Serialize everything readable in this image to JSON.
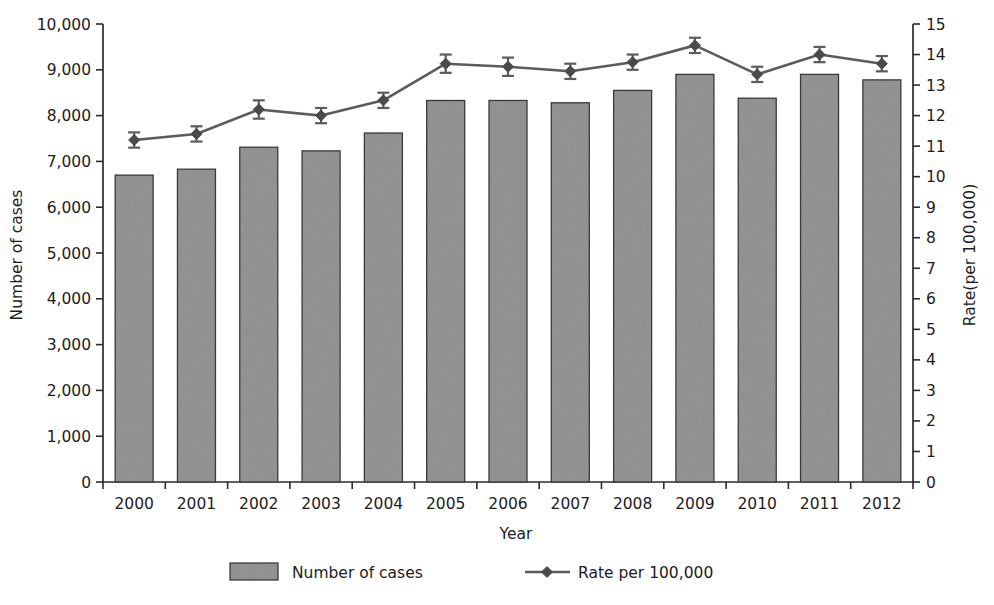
{
  "chart_data": {
    "type": "bar",
    "title": "",
    "subtitle": "",
    "xlabel": "Year",
    "ylabel": "Number of cases",
    "y2label": "Rate(per 100,000)",
    "categories": [
      "2000",
      "2001",
      "2002",
      "2003",
      "2004",
      "2005",
      "2006",
      "2007",
      "2008",
      "2009",
      "2010",
      "2011",
      "2012"
    ],
    "ylim": [
      0,
      10000
    ],
    "y2lim": [
      0,
      15
    ],
    "grid": false,
    "legend_position": "bottom",
    "y_ticks": [
      "0",
      "1,000",
      "2,000",
      "3,000",
      "4,000",
      "5,000",
      "6,000",
      "7,000",
      "8,000",
      "9,000",
      "10,000"
    ],
    "y_tick_values": [
      0,
      1000,
      2000,
      3000,
      4000,
      5000,
      6000,
      7000,
      8000,
      9000,
      10000
    ],
    "y2_ticks": [
      "0",
      "1",
      "2",
      "3",
      "4",
      "5",
      "6",
      "7",
      "8",
      "9",
      "10",
      "11",
      "12",
      "13",
      "14",
      "15"
    ],
    "y2_tick_values": [
      0,
      1,
      2,
      3,
      4,
      5,
      6,
      7,
      8,
      9,
      10,
      11,
      12,
      13,
      14,
      15
    ],
    "series": [
      {
        "name": "Number of cases",
        "kind": "bar",
        "axis": "left",
        "color": "#8a8a8a",
        "values": [
          6700,
          6830,
          7310,
          7230,
          7620,
          8330,
          8330,
          8280,
          8550,
          8900,
          8380,
          8900,
          8780
        ]
      },
      {
        "name": "Rate per 100,000",
        "kind": "line",
        "axis": "right",
        "color": "#5b5b5b",
        "values": [
          11.2,
          11.4,
          12.2,
          12.0,
          12.5,
          13.7,
          13.6,
          13.45,
          13.75,
          14.3,
          13.35,
          14.0,
          13.7
        ],
        "error_low": [
          10.95,
          11.15,
          11.9,
          11.75,
          12.25,
          13.4,
          13.3,
          13.2,
          13.5,
          14.05,
          13.1,
          13.75,
          13.45
        ],
        "error_high": [
          11.45,
          11.65,
          12.5,
          12.25,
          12.75,
          14.0,
          13.9,
          13.7,
          14.0,
          14.55,
          13.6,
          14.25,
          13.95
        ]
      }
    ],
    "legend": [
      {
        "label": "Number of cases",
        "marker": "filled-rect-swatch"
      },
      {
        "label": "Rate per 100,000",
        "marker": "line-with-diamond"
      }
    ]
  },
  "axes": {
    "left_title": "Number of cases",
    "right_title": "Rate(per 100,000)",
    "bottom_title": "Year"
  }
}
